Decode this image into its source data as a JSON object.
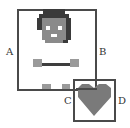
{
  "labels": {
    "a": "A",
    "b": "B",
    "c": "C",
    "d": "D"
  },
  "colors": {
    "frame": "#4a4a4a",
    "hair": "#3a3a3a",
    "face": "#8a8a8a",
    "eyes": "#ffffff",
    "mouth": "#ffffff",
    "arm": "#9a9a9a",
    "bar": "#3e3e3e",
    "foot": "#9a9a9a",
    "heart": "#7a7a7a"
  }
}
